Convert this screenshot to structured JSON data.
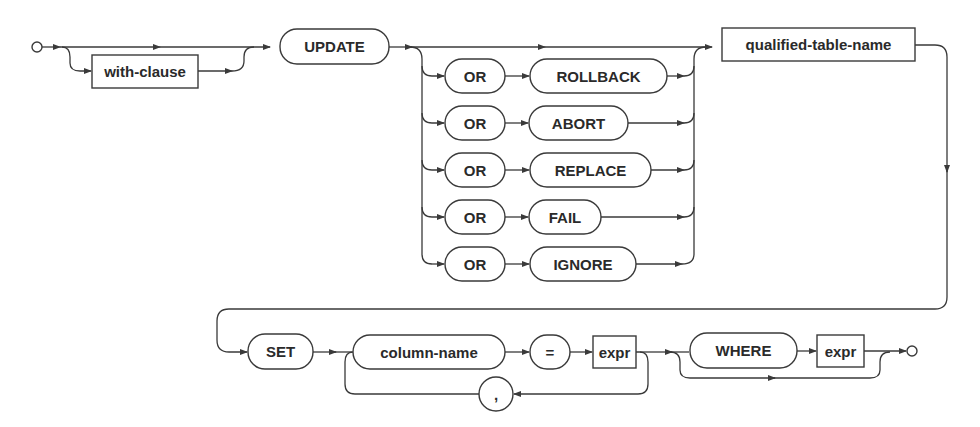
{
  "diagram": {
    "type": "railroad-syntax-diagram",
    "statement": "UPDATE",
    "colors": {
      "stroke": "#3a3a3a",
      "text": "#2a2a2a",
      "background": "#ffffff"
    },
    "nodes": {
      "with_clause": "with-clause",
      "update": "UPDATE",
      "or_options": [
        {
          "or": "OR",
          "action": "ROLLBACK"
        },
        {
          "or": "OR",
          "action": "ABORT"
        },
        {
          "or": "OR",
          "action": "REPLACE"
        },
        {
          "or": "OR",
          "action": "FAIL"
        },
        {
          "or": "OR",
          "action": "IGNORE"
        }
      ],
      "qualified_table_name": "qualified-table-name",
      "set": "SET",
      "column_name": "column-name",
      "equals": "=",
      "expr": "expr",
      "comma": ",",
      "where": "WHERE",
      "where_expr": "expr"
    },
    "legend": {
      "rounded_box": "keyword / literal token",
      "rectangle": "non-terminal rule reference"
    }
  }
}
